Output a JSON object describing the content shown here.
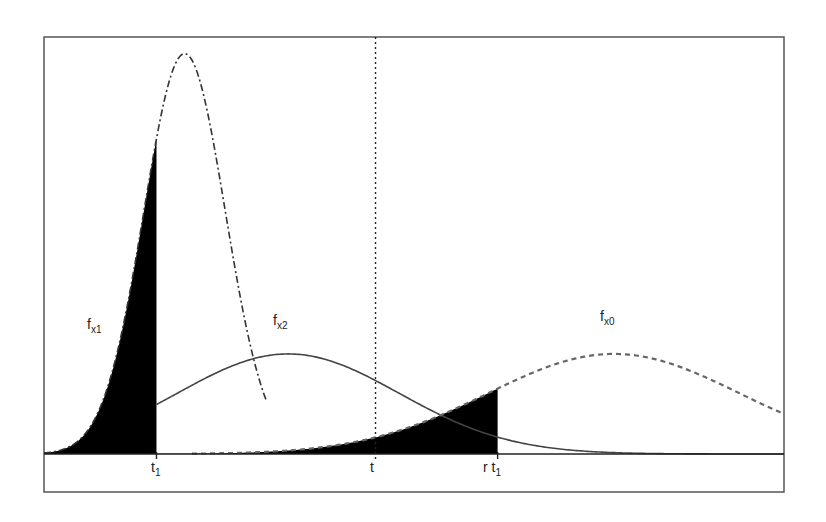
{
  "chart_data": {
    "type": "line",
    "title": "",
    "xlabel": "",
    "ylabel": "",
    "grid": false,
    "legend": "none",
    "x_range": [
      0,
      1
    ],
    "y_range": [
      0,
      1
    ],
    "curves": [
      {
        "name": "f_x1",
        "label_main": "f",
        "label_sub": "x1",
        "style": "dash-dot",
        "shape": "narrow peak",
        "peak_x": 0.19,
        "peak_y": 0.96,
        "spread": 0.055,
        "color": "#333333"
      },
      {
        "name": "f_x2",
        "label_main": "f",
        "label_sub": "x2",
        "style": "solid",
        "shape": "broad peak",
        "peak_x": 0.33,
        "peak_y": 0.24,
        "spread": 0.15,
        "color": "#444444"
      },
      {
        "name": "f_x0",
        "label_main": "f",
        "label_sub": "x0",
        "style": "dashed",
        "shape": "broad peak",
        "peak_x": 0.77,
        "peak_y": 0.24,
        "spread": 0.17,
        "color": "#666666"
      }
    ],
    "shaded_regions": [
      {
        "curve": "f_x1",
        "from": "start",
        "to": "t1",
        "color": "#000000"
      },
      {
        "curve": "f_x0",
        "from": "start",
        "to": "r t1",
        "color": "#000000"
      }
    ],
    "markers": [
      {
        "name": "t1",
        "label_main": "t",
        "label_sub": "1",
        "x": 0.152
      },
      {
        "name": "t",
        "label_main": "t",
        "label_sub": "",
        "x": 0.448,
        "line": "dotted"
      },
      {
        "name": "r t1",
        "label_main": "r t",
        "label_sub": "1",
        "x": 0.613
      }
    ]
  }
}
